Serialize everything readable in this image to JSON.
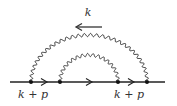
{
  "diagram": {
    "type": "feynman",
    "colors": {
      "stroke": "#222222",
      "text": "#333333",
      "background": "#ffffff"
    },
    "fermion_line": {
      "x1": 10,
      "x2": 165,
      "y": 82
    },
    "vertices": [
      {
        "x": 31,
        "y": 82
      },
      {
        "x": 60,
        "y": 82
      },
      {
        "x": 118,
        "y": 82
      },
      {
        "x": 147,
        "y": 82
      }
    ],
    "photons": [
      {
        "name": "outer",
        "from_vertex": 0,
        "to_vertex": 3,
        "peak_y": 35
      },
      {
        "name": "inner",
        "from_vertex": 1,
        "to_vertex": 2,
        "peak_y": 55
      }
    ],
    "momentum_arrow": {
      "label": "k",
      "direction": "left",
      "x1": 102,
      "x2": 76,
      "y": 27
    },
    "labels": {
      "top_k": "k",
      "left_momentum": "k + p",
      "right_momentum": "k + p"
    },
    "fermion_arrows": [
      {
        "x": 45,
        "direction": "right"
      },
      {
        "x": 90,
        "direction": "right"
      },
      {
        "x": 132,
        "direction": "right"
      }
    ]
  }
}
